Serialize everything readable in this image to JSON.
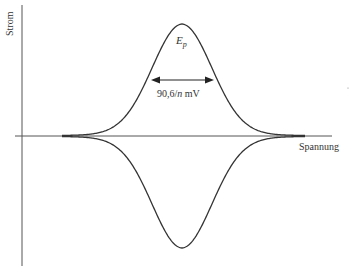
{
  "chart_data": {
    "type": "line",
    "title": "",
    "xlabel": "Spannung",
    "ylabel": "Strom",
    "annotations": {
      "peak_label": "E",
      "peak_label_sub": "p",
      "width_label_num": "90,6/",
      "width_label_var": "n",
      "width_label_unit": " mV"
    },
    "series": [
      {
        "name": "anodic",
        "shape": "gaussian-peak",
        "direction": "positive"
      },
      {
        "name": "cathodic",
        "shape": "gaussian-peak",
        "direction": "negative"
      }
    ],
    "grid": false,
    "legend": "none"
  },
  "colors": {
    "line": "#333333",
    "background": "#ffffff"
  }
}
